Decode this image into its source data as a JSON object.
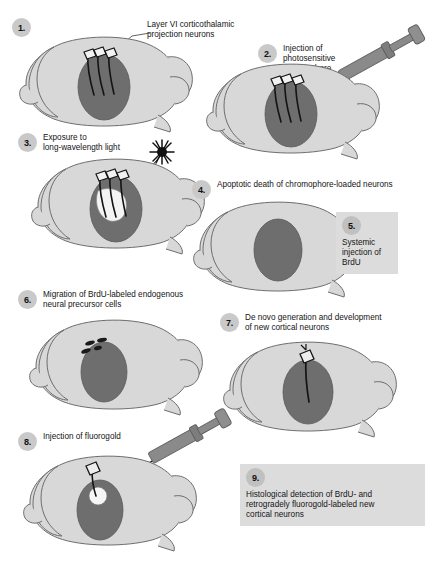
{
  "figure": {
    "background_color": "#ffffff",
    "brain_fill": "#d8d8d8",
    "brain_outline": "#6e6e6e",
    "thalamus_fill": "#6e6e6e",
    "badge_color": "#c9c9c9",
    "box_color": "#dcdcdc",
    "syringe_color": "#8a8a8a",
    "neuron_color": "#1a1a1a"
  },
  "steps": [
    {
      "number": "1.",
      "label": "Layer VI corticothalamic\nprojection neurons",
      "icon": "brain-lateral-icon",
      "boxed": false
    },
    {
      "number": "2.",
      "label": "Injection of\nphotosensitive\nchromophore",
      "icon": "syringe-icon",
      "boxed": false
    },
    {
      "number": "3.",
      "label": "Exposure to\nlong-wavelength light",
      "icon": "light-burst-icon",
      "boxed": false
    },
    {
      "number": "4.",
      "label": "Apoptotic death of chromophore-loaded neurons",
      "icon": "brain-lateral-icon",
      "boxed": false
    },
    {
      "number": "5.",
      "label": "Systemic\ninjection of\nBrdU",
      "icon": "none",
      "boxed": true
    },
    {
      "number": "6.",
      "label": "Migration of BrdU-labeled endogenous\nneural precursor cells",
      "icon": "migrating-cells-icon",
      "boxed": false
    },
    {
      "number": "7.",
      "label": "De novo generation and development\nof new cortical neurons",
      "icon": "new-neuron-icon",
      "boxed": false
    },
    {
      "number": "8.",
      "label": "Injection of fluorogold",
      "icon": "syringe-icon",
      "boxed": false
    },
    {
      "number": "9.",
      "label": "Histological detection of BrdU- and\nretrogradely fluorogold-labeled new\ncortical neurons",
      "icon": "none",
      "boxed": true
    }
  ]
}
